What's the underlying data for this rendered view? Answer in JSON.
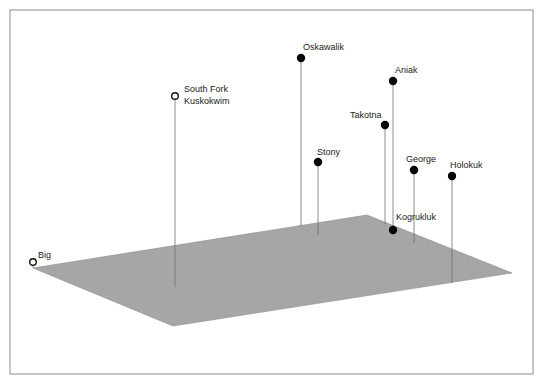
{
  "diagram": {
    "type": "3d-stem-plot",
    "plane": {
      "color": "#a6a6a6",
      "vertices": [
        [
          33,
          268
        ],
        [
          367,
          215
        ],
        [
          512,
          273
        ],
        [
          173,
          326
        ]
      ]
    },
    "frame": {
      "x": 10,
      "y": 10,
      "width": 523,
      "height": 364,
      "stroke": "#8c8c8c"
    },
    "points": [
      {
        "name": "Big",
        "label_lines": [
          "Big"
        ],
        "marker": "open",
        "x": 33,
        "y": 262,
        "base_y": 268,
        "label_x": 38,
        "label_y": 258
      },
      {
        "name": "South Fork Kuskokwim",
        "label_lines": [
          "South Fork",
          "Kuskokwim"
        ],
        "marker": "open",
        "x": 175,
        "y": 96,
        "base_y": 287,
        "label_x": 184,
        "label_y": 92
      },
      {
        "name": "Oskawalik",
        "label_lines": [
          "Oskawalik"
        ],
        "marker": "filled",
        "x": 301,
        "y": 58,
        "base_y": 226,
        "label_x": 303,
        "label_y": 50
      },
      {
        "name": "Aniak",
        "label_lines": [
          "Aniak"
        ],
        "marker": "filled",
        "x": 393,
        "y": 81,
        "base_y": 230,
        "label_x": 395,
        "label_y": 73
      },
      {
        "name": "Takotna",
        "label_lines": [
          "Takotna"
        ],
        "marker": "filled",
        "x": 385,
        "y": 125,
        "base_y": 224,
        "label_x": 350,
        "label_y": 118
      },
      {
        "name": "Stony",
        "label_lines": [
          "Stony"
        ],
        "marker": "filled",
        "x": 318,
        "y": 162,
        "base_y": 235,
        "label_x": 317,
        "label_y": 155
      },
      {
        "name": "George",
        "label_lines": [
          "George"
        ],
        "marker": "filled",
        "x": 414,
        "y": 170,
        "base_y": 243,
        "label_x": 406,
        "label_y": 162
      },
      {
        "name": "Holokuk",
        "label_lines": [
          "Holokuk"
        ],
        "marker": "filled",
        "x": 452,
        "y": 176,
        "base_y": 283,
        "label_x": 450,
        "label_y": 168
      },
      {
        "name": "Kogrukluk",
        "label_lines": [
          "Kogrukluk"
        ],
        "marker": "filled",
        "x": 393,
        "y": 230,
        "base_y": 230,
        "label_x": 396,
        "label_y": 220
      }
    ]
  }
}
